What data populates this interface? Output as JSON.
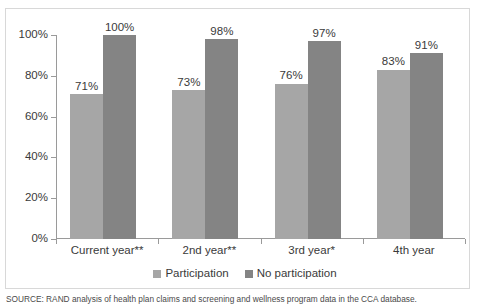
{
  "chart_data": {
    "type": "bar",
    "title": "",
    "subtitle": "",
    "xlabel": "",
    "ylabel": "",
    "ylim": [
      0,
      100
    ],
    "ytick_labels": [
      "0%",
      "20%",
      "40%",
      "60%",
      "80%",
      "100%"
    ],
    "ytick_values": [
      0,
      20,
      40,
      60,
      80,
      100
    ],
    "grid": false,
    "legend_position": "bottom-center",
    "categories": [
      "Current year**",
      "2nd year**",
      "3rd year*",
      "4th year"
    ],
    "series": [
      {
        "name": "Participation",
        "color": "#a6a6a6",
        "values": [
          71,
          73,
          76,
          83
        ],
        "labels": [
          "71%",
          "73%",
          "76%",
          "83%"
        ]
      },
      {
        "name": "No participation",
        "color": "#848484",
        "values": [
          100,
          98,
          97,
          91
        ],
        "labels": [
          "100%",
          "98%",
          "97%",
          "91%"
        ]
      }
    ]
  },
  "legend": {
    "items": [
      {
        "label": "Participation",
        "color": "#a6a6a6"
      },
      {
        "label": "No participation",
        "color": "#848484"
      }
    ]
  },
  "source": {
    "note": "SOURCE: RAND analysis of health plan claims and screening and wellness program data in the CCA database."
  },
  "colors": {
    "participation": "#a6a6a6",
    "no_participation": "#848484",
    "axis": "#9a9a9a",
    "frame": "#d8d8d8",
    "text": "#3a3a3a",
    "background": "#ffffff"
  }
}
